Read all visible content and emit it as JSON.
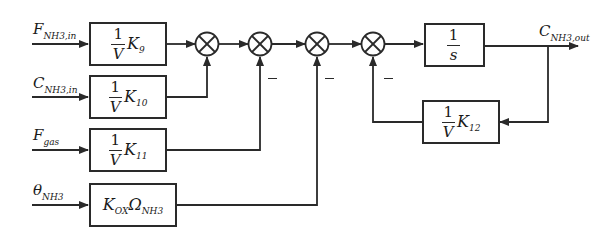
{
  "diagram": {
    "type": "block-diagram",
    "inputs": [
      {
        "id": "f_nh3_in",
        "symbol": "F",
        "subscript": "NH3,in"
      },
      {
        "id": "c_nh3_in",
        "symbol": "C",
        "subscript": "NH3,in"
      },
      {
        "id": "f_gas",
        "symbol": "F",
        "subscript": "gas"
      },
      {
        "id": "theta_nh3",
        "symbol": "θ",
        "subscript": "NH3"
      }
    ],
    "blocks": [
      {
        "id": "k9",
        "numerator": "1",
        "denominator": "V",
        "gain": "K",
        "gain_sub": "9"
      },
      {
        "id": "k10",
        "numerator": "1",
        "denominator": "V",
        "gain": "K",
        "gain_sub": "10"
      },
      {
        "id": "k11",
        "numerator": "1",
        "denominator": "V",
        "gain": "K",
        "gain_sub": "11"
      },
      {
        "id": "kox",
        "gain": "K",
        "gain_sub": "OX",
        "omega": "Ω",
        "omega_sub": "NH3"
      },
      {
        "id": "integrator",
        "numerator": "1",
        "denominator": "s"
      },
      {
        "id": "k12",
        "numerator": "1",
        "denominator": "V",
        "gain": "K",
        "gain_sub": "12"
      }
    ],
    "summing_junctions": [
      {
        "id": "sum1",
        "inputs": [
          "k9 (+)",
          "k10 (+)"
        ]
      },
      {
        "id": "sum2",
        "inputs": [
          "sum1 (+)",
          "k11 (−)"
        ],
        "sign_label": "−"
      },
      {
        "id": "sum3",
        "inputs": [
          "sum2 (+)",
          "kox (−)"
        ],
        "sign_label": "−"
      },
      {
        "id": "sum4",
        "inputs": [
          "sum3 (+)",
          "k12 (−)"
        ],
        "sign_label": "−"
      }
    ],
    "output": {
      "id": "c_nh3_out",
      "symbol": "C",
      "subscript": "NH3,out"
    },
    "line_color": "#2a2a2a"
  }
}
